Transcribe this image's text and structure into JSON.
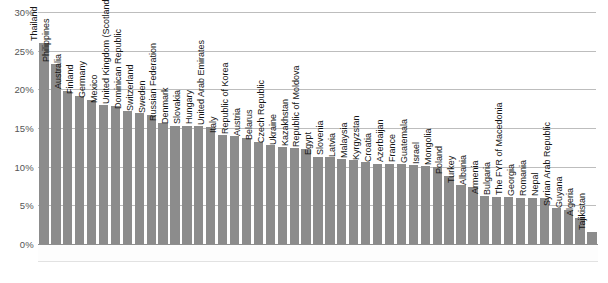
{
  "chart_data": {
    "type": "bar",
    "title": "",
    "subtitle": "",
    "xlabel": "",
    "ylabel": "",
    "ylim": [
      0,
      30
    ],
    "ytick_labels": [
      "0%",
      "5%",
      "10%",
      "15%",
      "20%",
      "25%",
      "30%"
    ],
    "ytick_values": [
      0,
      5,
      10,
      15,
      20,
      25,
      30
    ],
    "grid": true,
    "legend": "none",
    "orientation": "vertical",
    "bar_color": "#8c8c8c",
    "gridline_color": "#bdbdbd",
    "axis_text_color": "#555555",
    "label_text_color": "#151515",
    "label_rotation_degrees": 90,
    "label_position": "above-bar",
    "categories": [
      "Thailand",
      "Philippines",
      "Australia",
      "Finland",
      "Germany",
      "Mexico",
      "United Kingdom (Scotland)",
      "Dominican Republic",
      "Switzerland",
      "Sweden",
      "Russian Federation",
      "Denmark",
      "Slovakia",
      "Hungary",
      "United Arab Emirates",
      "Italy",
      "Republic of Korea",
      "Austria",
      "Belarus",
      "Czech Republic",
      "Ukraine",
      "Kazakhstan",
      "Republic of Moldova",
      "Egypt",
      "Slovenia",
      "Latvia",
      "Malaysia",
      "Kyrgyzstan",
      "Croatia",
      "Azerbaijan",
      "France",
      "Guatemala",
      "Israel",
      "Mongolia",
      "Poland",
      "Turkey",
      "Albania",
      "Armenia",
      "Bulgaria",
      "The FYR of Macedonia",
      "Georgia",
      "Romania",
      "Nepal",
      "Syrian Arab Republic",
      "Guyana",
      "Algeria",
      "Tajikistan"
    ],
    "values": [
      26.0,
      23.3,
      19.8,
      19.1,
      18.6,
      18.0,
      17.9,
      17.2,
      17.0,
      16.7,
      15.6,
      15.3,
      15.2,
      15.2,
      15.1,
      14.1,
      14.0,
      13.7,
      13.2,
      12.8,
      12.6,
      12.4,
      12.3,
      11.3,
      11.2,
      11.0,
      10.8,
      10.6,
      10.4,
      10.4,
      10.3,
      10.2,
      10.1,
      9.9,
      8.8,
      7.6,
      7.4,
      6.2,
      6.1,
      6.1,
      6.0,
      6.0,
      5.9,
      4.6,
      4.4,
      3.3,
      1.6
    ]
  }
}
